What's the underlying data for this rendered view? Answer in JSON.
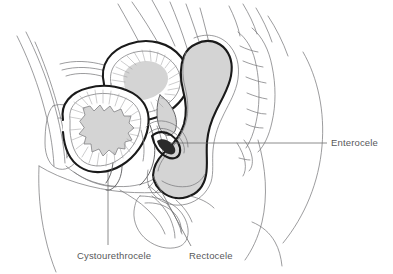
{
  "figure": {
    "background_color": "#ffffff",
    "line_color": "#58585a",
    "thin_line_color": "#7b7b7e",
    "bold_outline_color": "#1a1a1a",
    "organ_fill_color": "#d4d4d4",
    "hatch_color": "#9a9a9d",
    "label_color": "#58585a"
  },
  "labels": [
    {
      "id": "enterocele",
      "text": "Enterocele",
      "x": 331,
      "y": 143,
      "anchor": "start",
      "leader": "M 170 143 L 327 143",
      "leader_type": "horizontal"
    },
    {
      "id": "cystourethrocele",
      "text": "Cystourethrocele",
      "x": 77,
      "y": 256,
      "anchor": "start",
      "leader": "M 108 172 L 108 245",
      "leader_type": "vertical"
    },
    {
      "id": "rectocele",
      "text": "Rectocele",
      "x": 189,
      "y": 256,
      "anchor": "start",
      "leader": "M 153 176 L 191 246",
      "leader_type": "diagonal"
    }
  ],
  "anatomy": {
    "organs": [
      {
        "id": "bladder",
        "name": "Bladder (cystourethrocele)",
        "filled": true
      },
      {
        "id": "uterus",
        "name": "Uterus",
        "filled": true
      },
      {
        "id": "rectum",
        "name": "Rectum (rectocele)",
        "filled": true
      },
      {
        "id": "enterocele-pocket",
        "name": "Enterocele pocket",
        "filled": true
      },
      {
        "id": "sacrum",
        "name": "Sacrum and coccyx",
        "filled": false
      },
      {
        "id": "pubic-bone",
        "name": "Pubic symphysis",
        "filled": false
      },
      {
        "id": "abdominal-wall",
        "name": "Abdominal wall",
        "filled": false
      },
      {
        "id": "body-contour",
        "name": "Body contour",
        "filled": false
      },
      {
        "id": "perineum",
        "name": "Perineum and vagina",
        "filled": false
      }
    ]
  }
}
